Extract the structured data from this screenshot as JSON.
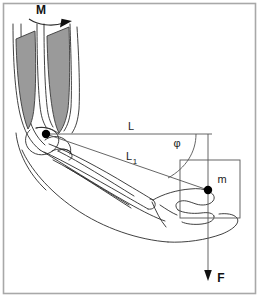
{
  "figure": {
    "type": "diagram",
    "canvas": {
      "width": 259,
      "height": 297
    },
    "border_color": "#a8a8a8",
    "line_color": "#2b2b2b",
    "construction_line_color": "#555555",
    "muscle_fill_color": "#9a9a9a",
    "muscle_stroke_color": "#3a3a3a",
    "point_color": "#000000",
    "background_color": "#ffffff"
  },
  "labels": {
    "moment": "M",
    "lever_long": "L",
    "lever_short_base": "L",
    "lever_short_sub": "1",
    "angle": "φ",
    "mass": "m",
    "force": "F"
  },
  "annotations": [
    {
      "name": "moment-arrow",
      "label": "M",
      "meaning": "applied muscle moment, curved arrow pointing right"
    },
    {
      "name": "lever-L",
      "label": "L",
      "meaning": "horizontal distance from elbow joint to load line of action"
    },
    {
      "name": "lever-L1",
      "label": "L1",
      "meaning": "distance from elbow joint to hand along the forearm"
    },
    {
      "name": "angle-phi",
      "label": "φ",
      "meaning": "angle between L and L1"
    },
    {
      "name": "mass-m",
      "label": "m",
      "meaning": "mass held in the hand"
    },
    {
      "name": "force-F",
      "label": "F",
      "meaning": "weight force acting downward"
    }
  ],
  "points": [
    {
      "name": "elbow-joint-point",
      "label": "",
      "x": 46,
      "y": 134
    },
    {
      "name": "center-of-mass-point",
      "label": "",
      "x": 208,
      "y": 190
    }
  ]
}
